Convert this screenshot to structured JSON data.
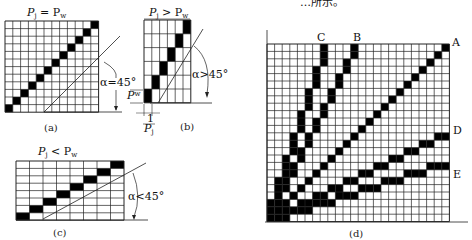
{
  "header_fragment": "…所示。",
  "panels": {
    "a": {
      "title": "P_j = P_w",
      "title_main": "P",
      "title_sub1": "j",
      "title_rel": " = P",
      "title_sub2": "w",
      "angle_label": "α=45°",
      "caption": "(a)",
      "cols": 12,
      "rows": 12,
      "filled": [
        [
          0,
          0
        ],
        [
          1,
          1
        ],
        [
          2,
          2
        ],
        [
          3,
          3
        ],
        [
          4,
          4
        ],
        [
          5,
          5
        ],
        [
          6,
          6
        ],
        [
          7,
          7
        ],
        [
          8,
          8
        ],
        [
          9,
          9
        ],
        [
          10,
          10
        ],
        [
          11,
          11
        ]
      ]
    },
    "b": {
      "title_main": "P",
      "title_sub1": "j",
      "title_rel": " > P",
      "title_sub2": "w",
      "angle_label": "α>45°",
      "pw_label": "P",
      "pw_sub": "w",
      "pj_label_num": "1",
      "pj_label_den": "P",
      "pj_sub": "j",
      "caption": "(b)",
      "cols": 6,
      "rows": 6,
      "filled": [
        [
          0,
          0
        ],
        [
          1,
          1
        ],
        [
          2,
          2
        ],
        [
          3,
          3
        ],
        [
          4,
          4
        ],
        [
          5,
          5
        ]
      ]
    },
    "c": {
      "title_main": "P",
      "title_sub1": "j",
      "title_rel": " < P",
      "title_sub2": "w",
      "angle_label": "α<45°",
      "caption": "(c)",
      "cols": 8,
      "rows": 8,
      "filled": [
        [
          0,
          0
        ],
        [
          1,
          1
        ],
        [
          2,
          2
        ],
        [
          3,
          3
        ],
        [
          4,
          4
        ],
        [
          5,
          5
        ],
        [
          6,
          6
        ],
        [
          7,
          7
        ]
      ]
    },
    "d": {
      "caption": "(d)",
      "cols": 24,
      "rows": 24,
      "line_labels": [
        "A",
        "B",
        "C",
        "D",
        "E"
      ],
      "lines": {
        "A": {
          "slope": "1",
          "desc": "45° diagonal"
        },
        "B": {
          "slope": "2",
          "desc": "steep"
        },
        "C": {
          "slope": "3",
          "desc": "steeper"
        },
        "D": {
          "slope": "1/2",
          "desc": "shallow"
        },
        "E": {
          "slope": "1/3",
          "desc": "shallower"
        }
      }
    }
  }
}
